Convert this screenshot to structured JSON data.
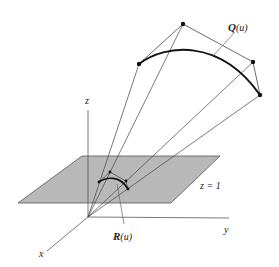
{
  "diagram": {
    "colors": {
      "background": "#ffffff",
      "plane_fill": "#b8b8b8",
      "plane_stroke": "#555555",
      "line": "#444444",
      "curve": "#111111",
      "point": "#111111"
    },
    "labels": {
      "z_axis": "z",
      "y_axis": "y",
      "x_axis": "x",
      "plane": "z = 1",
      "curve_q": "Q",
      "curve_q_arg": "(u)",
      "curve_r": "R",
      "curve_r_arg": "(u)"
    },
    "origin": [
      88,
      217
    ],
    "axes": {
      "z": {
        "from": [
          88,
          217
        ],
        "to": [
          88,
          110
        ]
      },
      "y": {
        "from": [
          88,
          217
        ],
        "to": [
          229,
          218
        ]
      },
      "x": {
        "from": [
          88,
          217
        ],
        "to": [
          47,
          251
        ]
      }
    },
    "plane_polygon": [
      [
        82,
        156
      ],
      [
        220,
        156
      ],
      [
        171,
        203
      ],
      [
        18,
        203
      ]
    ],
    "control_points_q": [
      [
        139,
        64
      ],
      [
        183,
        24
      ],
      [
        253,
        62
      ],
      [
        260,
        95
      ]
    ],
    "projected_points_r": [
      [
        99,
        182
      ],
      [
        110,
        172
      ],
      [
        126,
        181
      ],
      [
        128,
        189
      ]
    ]
  }
}
